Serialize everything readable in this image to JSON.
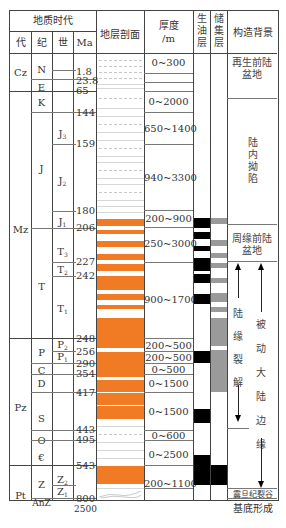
{
  "header": {
    "geologic_time": "地质时代",
    "era": "代",
    "period": "纪",
    "epoch": "世",
    "ma": "Ma",
    "section": "地层剖面",
    "thickness": "厚度",
    "thickness_unit": "/m",
    "source_layer": "生油层",
    "reservoir_layer": "储集层",
    "tectonic_setting": "构造背景"
  },
  "eras": [
    {
      "label": "Cz"
    },
    {
      "label": "Mz"
    },
    {
      "label": "Pz"
    },
    {
      "label": "Pt"
    }
  ],
  "periods": [
    {
      "label": "N"
    },
    {
      "label": "E"
    },
    {
      "label": "K"
    },
    {
      "label": "J"
    },
    {
      "label": "T"
    },
    {
      "label": "P"
    },
    {
      "label": "C"
    },
    {
      "label": "D"
    },
    {
      "label": "S"
    },
    {
      "label": "O"
    },
    {
      "label": "€"
    },
    {
      "label": "Z"
    },
    {
      "label": "AnZ"
    }
  ],
  "epochs": [
    {
      "base": "J",
      "sub": "3"
    },
    {
      "base": "J",
      "sub": "2"
    },
    {
      "base": "J",
      "sub": "1"
    },
    {
      "base": "T",
      "sub": "3"
    },
    {
      "base": "T",
      "sub": "2"
    },
    {
      "base": "T",
      "sub": "1"
    },
    {
      "base": "P",
      "sub": "2"
    },
    {
      "base": "P",
      "sub": "1"
    },
    {
      "base": "Z",
      "sub": "2"
    },
    {
      "base": "Z",
      "sub": "1"
    }
  ],
  "ages_ma": [
    "1.8",
    "23.8",
    "65",
    "144",
    "159",
    "180",
    "206",
    "227",
    "242",
    "248",
    "256",
    "290",
    "354",
    "417",
    "443",
    "495",
    "543",
    "800",
    "2500"
  ],
  "thickness_values": [
    "0~300",
    "0~2000",
    "650~1400",
    "940~3300",
    "200~900",
    "250~3000",
    "900~1700",
    "200~500",
    "200~500",
    "0~500",
    "0~1500",
    "0~1500",
    "0~600",
    "0~2500",
    "200~1100"
  ],
  "tectonic": {
    "regen_foreland": "再生前陆盆地",
    "intracontinental_depression": "陆内拗陷",
    "peripheral_foreland": "周缘前陆盆地",
    "continental_margin_rift": "陆缘裂解",
    "passive_margin": "被动大陆边缘",
    "sinian_rift": "震旦纪裂谷",
    "basement": "基底形成"
  },
  "colors": {
    "sandstone": "#f07b24",
    "source_rock": "#000000",
    "reservoir": "#9a9a9a",
    "border": "#444444"
  }
}
